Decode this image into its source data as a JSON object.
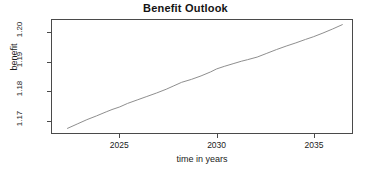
{
  "chart_data": {
    "type": "line",
    "title": "Benefit Outlook",
    "xlabel": "time in years",
    "ylabel": "benefit",
    "grid": false,
    "legend": null,
    "xlim": [
      2021.5,
      2037.0
    ],
    "ylim": [
      1.1655,
      1.2045
    ],
    "xticks": [
      2025,
      2030,
      2035
    ],
    "xticklabels": [
      "2025",
      "2030",
      "2035"
    ],
    "yticks": [
      1.17,
      1.18,
      1.19,
      1.2
    ],
    "yticklabels": [
      "1.17",
      "1.18",
      "1.19",
      "1.20"
    ],
    "line_color": "#8c8c8c",
    "frame_color": "#4a4a4a",
    "series": [
      {
        "name": "benefit",
        "x": [
          2022.3,
          2022.8,
          2023.3,
          2023.8,
          2024.3,
          2024.6,
          2025.0,
          2025.4,
          2025.9,
          2026.4,
          2026.9,
          2027.4,
          2027.8,
          2028.2,
          2028.7,
          2029.2,
          2029.7,
          2030.0,
          2030.4,
          2030.9,
          2031.3,
          2031.6,
          2032.1,
          2032.6,
          2033.1,
          2033.6,
          2034.1,
          2034.6,
          2035.0,
          2035.5,
          2036.0,
          2036.5
        ],
        "y": [
          1.1671,
          1.1686,
          1.1701,
          1.1714,
          1.1728,
          1.1736,
          1.1745,
          1.1757,
          1.1769,
          1.1781,
          1.1793,
          1.1806,
          1.1818,
          1.183,
          1.184,
          1.1852,
          1.1866,
          1.1876,
          1.1885,
          1.1895,
          1.1903,
          1.1908,
          1.1917,
          1.193,
          1.1943,
          1.1955,
          1.1966,
          1.1978,
          1.1987,
          1.2,
          1.2014,
          1.2029
        ]
      }
    ]
  }
}
